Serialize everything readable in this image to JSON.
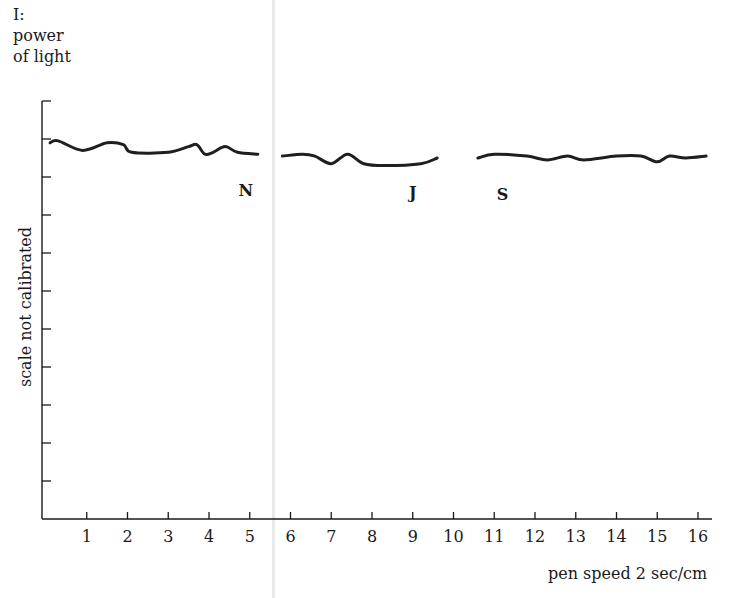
{
  "chart_data": {
    "type": "line",
    "title": "",
    "ylabel_top": [
      "I:",
      "power",
      "of light"
    ],
    "ylabel": "scale not calibrated",
    "xlabel": "pen speed 2 sec/cm",
    "x_ticks": [
      "1",
      "2",
      "3",
      "4",
      "5",
      "6",
      "7",
      "8",
      "9",
      "10",
      "11",
      "12",
      "13",
      "14",
      "15",
      "16"
    ],
    "xlim": [
      0,
      16.3
    ],
    "y_ticks_count": 11,
    "y_tick_labels": [],
    "grid": false,
    "legend": null,
    "annotations": [
      {
        "text": "N",
        "x": 5.0,
        "position": "below curve"
      },
      {
        "text": "J",
        "x": 9.1,
        "position": "below curve"
      },
      {
        "text": "S",
        "x": 11.3,
        "position": "below curve"
      }
    ],
    "series": [
      {
        "name": "segment-N",
        "note": "approx. relative height (0 = axis bottom, 10 = top tick), uncalibrated",
        "x": [
          0.1,
          0.3,
          0.9,
          1.5,
          1.9,
          2.1,
          3.0,
          3.5,
          3.7,
          3.9,
          4.1,
          4.4,
          4.7,
          5.2
        ],
        "y": [
          9.9,
          9.95,
          9.7,
          9.9,
          9.85,
          9.65,
          9.65,
          9.8,
          9.85,
          9.6,
          9.65,
          9.8,
          9.65,
          9.6
        ]
      },
      {
        "name": "segment-J",
        "x": [
          5.8,
          6.3,
          6.6,
          7.0,
          7.4,
          7.8,
          8.3,
          9.2,
          9.6
        ],
        "y": [
          9.55,
          9.6,
          9.55,
          9.35,
          9.6,
          9.35,
          9.3,
          9.35,
          9.5
        ]
      },
      {
        "name": "segment-S",
        "x": [
          10.6,
          11.0,
          11.8,
          12.3,
          12.8,
          13.2,
          14.0,
          14.6,
          15.0,
          15.3,
          15.7,
          16.2
        ],
        "y": [
          9.5,
          9.6,
          9.55,
          9.45,
          9.55,
          9.45,
          9.55,
          9.55,
          9.4,
          9.55,
          9.5,
          9.55
        ]
      }
    ]
  }
}
